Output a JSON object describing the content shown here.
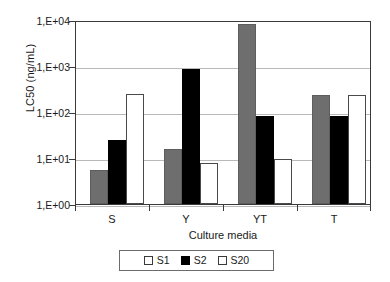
{
  "chart_data": {
    "type": "bar",
    "title": "",
    "xlabel": "Culture media",
    "ylabel": "LC50 (ng/mL)",
    "categories": [
      "S",
      "Y",
      "YT",
      "T"
    ],
    "yscale": "log",
    "ylim": [
      1,
      10000
    ],
    "ytick_labels": [
      "1,E+04",
      "1,E+03",
      "1,E+02",
      "1,E+01",
      "1,E+00"
    ],
    "ytick_values": [
      10000,
      1000,
      100,
      10,
      1
    ],
    "grid": true,
    "legend_position": "bottom",
    "series": [
      {
        "name": "S1",
        "color": "#6e6e6e",
        "values": [
          5.5,
          16,
          8200,
          237
        ]
      },
      {
        "name": "S2",
        "color": "#000000",
        "values": [
          25,
          860,
          81,
          81
        ]
      },
      {
        "name": "S20",
        "color": "#ffffff",
        "values": [
          246,
          7.8,
          9.5,
          235
        ]
      }
    ]
  },
  "axis": {
    "y_title": "LC50 (ng/mL)",
    "x_title": "Culture media",
    "y_ticks": [
      {
        "label": "1,E+04",
        "value": 10000
      },
      {
        "label": "1,E+03",
        "value": 1000
      },
      {
        "label": "1,E+02",
        "value": 100
      },
      {
        "label": "1,E+01",
        "value": 10
      },
      {
        "label": "1,E+00",
        "value": 1
      }
    ],
    "x_ticks": [
      "S",
      "Y",
      "YT",
      "T"
    ]
  },
  "legend": {
    "entries": [
      {
        "label": "S1",
        "fill": "light"
      },
      {
        "label": "S2",
        "fill": "filled"
      },
      {
        "label": "S20",
        "fill": "light"
      }
    ]
  }
}
